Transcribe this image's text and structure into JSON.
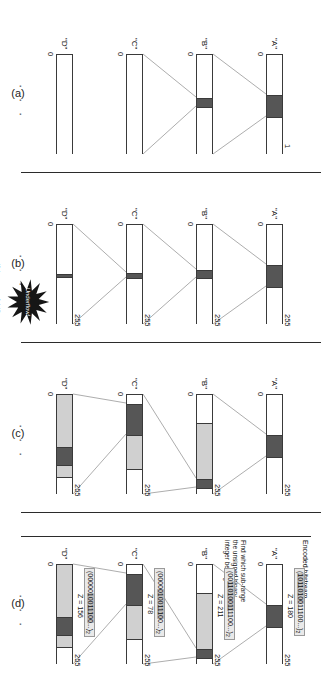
{
  "figure": {
    "caption_labels": [
      "(a)",
      "(b)",
      "(c)",
      "(d)"
    ],
    "bitstream_title": "Encoded bitstream",
    "annotation_note": "Find which sub-range\nthe unsigned binary\ninteger belongs to",
    "underflow_label": "Underflow!",
    "underflow_condition": "if (range < 1-bit)",
    "ellipsis": "· · ·",
    "colors": {
      "dark_segment": "#565656",
      "light_segment": "#d0d0d0",
      "outline": "#3a3a3a",
      "code_box_fill": "#e9e9e9",
      "code_box_highlight": "#bdbdbd",
      "burst_fill": "#161616",
      "separator": "#2b2b2b"
    }
  },
  "panels": [
    {
      "id": "a",
      "label": "(a)",
      "axis_low": "0",
      "axis_high": "1",
      "bars": [
        {
          "name": "\"A\"",
          "low_label": "0",
          "high_label": "1",
          "segments": [
            {
              "type": "mid",
              "from": 0.0,
              "to": 0.4
            },
            {
              "type": "dark",
              "from": 0.4,
              "to": 0.62
            },
            {
              "type": "mid",
              "from": 0.62,
              "to": 1.0
            }
          ]
        },
        {
          "name": "\"B\"",
          "low_label": "0",
          "high_label": "",
          "segments": [
            {
              "type": "mid",
              "from": 0.0,
              "to": 0.43
            },
            {
              "type": "dark",
              "from": 0.43,
              "to": 0.52
            },
            {
              "type": "mid",
              "from": 0.52,
              "to": 1.0
            }
          ]
        },
        {
          "name": "\"C\"",
          "low_label": "0",
          "high_label": "",
          "segments": [
            {
              "type": "mid",
              "from": 0.0,
              "to": 1.0
            }
          ]
        },
        {
          "name": "\"D\"",
          "low_label": "0",
          "high_label": "",
          "segments": [
            {
              "type": "mid",
              "from": 0.0,
              "to": 1.0
            }
          ]
        }
      ]
    },
    {
      "id": "b",
      "label": "(b)",
      "axis_low": "0",
      "axis_high": "255",
      "underflow": true,
      "bars": [
        {
          "name": "\"A\"",
          "low_label": "0",
          "high_label": "255",
          "segments": [
            {
              "type": "mid",
              "from": 0.0,
              "to": 0.4
            },
            {
              "type": "dark",
              "from": 0.4,
              "to": 0.62
            },
            {
              "type": "mid",
              "from": 0.62,
              "to": 1.0
            }
          ]
        },
        {
          "name": "\"B\"",
          "low_label": "0",
          "high_label": "255",
          "segments": [
            {
              "type": "mid",
              "from": 0.0,
              "to": 0.45
            },
            {
              "type": "dark",
              "from": 0.45,
              "to": 0.53
            },
            {
              "type": "mid",
              "from": 0.53,
              "to": 1.0
            }
          ]
        },
        {
          "name": "\"C\"",
          "low_label": "0",
          "high_label": "255",
          "segments": [
            {
              "type": "mid",
              "from": 0.0,
              "to": 0.48
            },
            {
              "type": "dark",
              "from": 0.48,
              "to": 0.53
            },
            {
              "type": "mid",
              "from": 0.53,
              "to": 1.0
            }
          ]
        },
        {
          "name": "\"D\"",
          "low_label": "0",
          "high_label": "255",
          "segments": [
            {
              "type": "mid",
              "from": 0.0,
              "to": 0.49
            },
            {
              "type": "dark",
              "from": 0.49,
              "to": 0.52
            },
            {
              "type": "mid",
              "from": 0.52,
              "to": 1.0
            }
          ]
        }
      ]
    },
    {
      "id": "c",
      "label": "(c)",
      "axis_low": "0",
      "axis_high": "255",
      "bars": [
        {
          "name": "\"A\"",
          "low_label": "0",
          "high_label": "255",
          "segments": [
            {
              "type": "mid",
              "from": 0.0,
              "to": 0.4
            },
            {
              "type": "dark",
              "from": 0.4,
              "to": 0.62
            },
            {
              "type": "mid",
              "from": 0.62,
              "to": 1.0
            }
          ]
        },
        {
          "name": "\"B\"",
          "low_label": "0",
          "high_label": "255",
          "segments": [
            {
              "type": "mid",
              "from": 0.0,
              "to": 0.28
            },
            {
              "type": "light",
              "from": 0.28,
              "to": 0.84
            },
            {
              "type": "dark",
              "from": 0.84,
              "to": 0.93
            },
            {
              "type": "mid",
              "from": 0.93,
              "to": 1.0
            }
          ]
        },
        {
          "name": "\"C\"",
          "low_label": "0",
          "high_label": "255",
          "segments": [
            {
              "type": "mid",
              "from": 0.0,
              "to": 0.09
            },
            {
              "type": "dark",
              "from": 0.09,
              "to": 0.4
            },
            {
              "type": "light",
              "from": 0.4,
              "to": 0.74
            },
            {
              "type": "mid",
              "from": 0.74,
              "to": 1.0
            }
          ]
        },
        {
          "name": "\"D\"",
          "low_label": "0",
          "high_label": "255",
          "segments": [
            {
              "type": "light",
              "from": 0.0,
              "to": 0.52
            },
            {
              "type": "dark",
              "from": 0.52,
              "to": 0.7
            },
            {
              "type": "light",
              "from": 0.7,
              "to": 0.82
            },
            {
              "type": "mid",
              "from": 0.82,
              "to": 1.0
            }
          ]
        }
      ]
    },
    {
      "id": "d",
      "label": "(d)",
      "axis_low": "0",
      "axis_high": "255",
      "show_bitstream": true,
      "show_note": true,
      "bars": [
        {
          "name": "\"A\"",
          "low_label": "0",
          "high_label": "255",
          "code_prefix": "(",
          "code_highlight": "10110100",
          "code_suffix": "11100...)",
          "code_sub": "2",
          "z_label": "Z = 180",
          "segments": [
            {
              "type": "mid",
              "from": 0.0,
              "to": 0.4
            },
            {
              "type": "dark",
              "from": 0.4,
              "to": 0.62
            },
            {
              "type": "mid",
              "from": 0.62,
              "to": 1.0
            }
          ]
        },
        {
          "name": "\"B\"",
          "low_label": "0",
          "high_label": "255",
          "code_prefix": "(00",
          "code_highlight": "11010011",
          "code_suffix": "1100...)",
          "code_sub": "2",
          "z_label": "Z = 211",
          "segments": [
            {
              "type": "mid",
              "from": 0.0,
              "to": 0.28
            },
            {
              "type": "light",
              "from": 0.28,
              "to": 0.84
            },
            {
              "type": "dark",
              "from": 0.84,
              "to": 0.93
            },
            {
              "type": "mid",
              "from": 0.93,
              "to": 1.0
            }
          ]
        },
        {
          "name": "\"C\"",
          "low_label": "0",
          "high_label": "255",
          "code_prefix": "(0000",
          "code_highlight": "01001110",
          "code_suffix": "0...)",
          "code_sub": "2",
          "z_label": "Z = 78",
          "segments": [
            {
              "type": "mid",
              "from": 0.0,
              "to": 0.09
            },
            {
              "type": "dark",
              "from": 0.09,
              "to": 0.4
            },
            {
              "type": "light",
              "from": 0.4,
              "to": 0.74
            },
            {
              "type": "mid",
              "from": 0.74,
              "to": 1.0
            }
          ]
        },
        {
          "name": "\"D\"",
          "low_label": "0",
          "high_label": "255",
          "code_prefix": "(00000",
          "code_highlight": "10011100",
          "code_suffix": "...)",
          "code_sub": "2",
          "z_label": "Z = 156",
          "segments": [
            {
              "type": "light",
              "from": 0.0,
              "to": 0.52
            },
            {
              "type": "dark",
              "from": 0.52,
              "to": 0.7
            },
            {
              "type": "light",
              "from": 0.7,
              "to": 0.82
            },
            {
              "type": "mid",
              "from": 0.82,
              "to": 1.0
            }
          ]
        }
      ]
    }
  ]
}
